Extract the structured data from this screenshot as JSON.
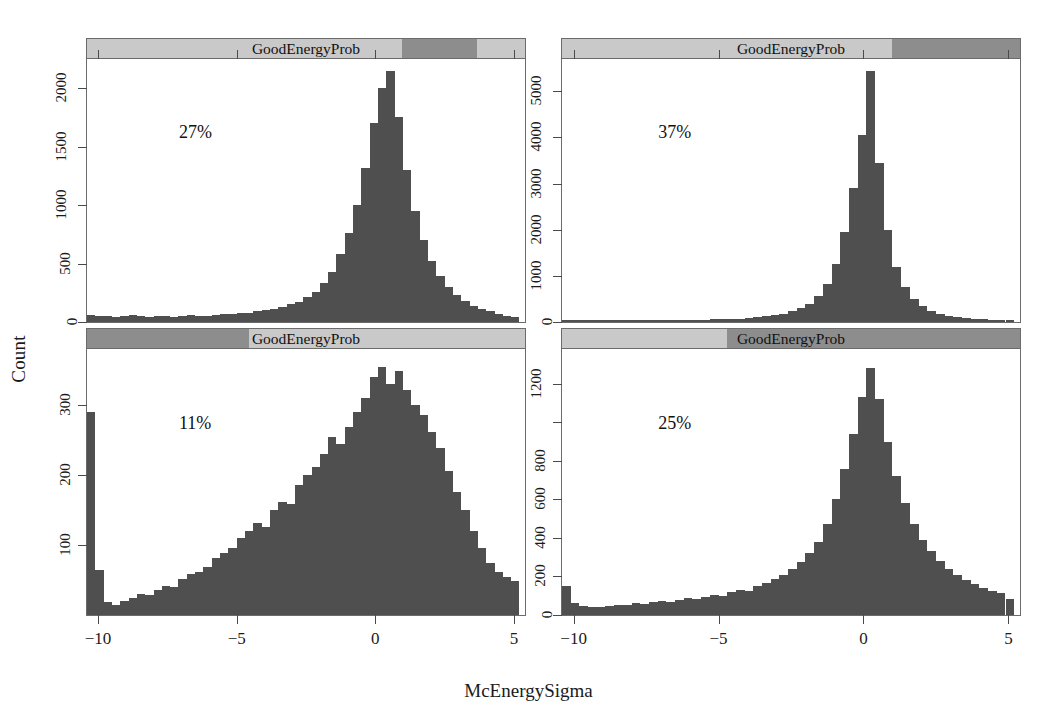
{
  "figure": {
    "ylabel": "Count",
    "xlabel": "McEnergySigma",
    "strip_label": "GoodEnergyProb",
    "bar_color": "#4f4f4f",
    "strip_color": "#c9c9c9",
    "strip_band_color": "#8d8d8d"
  },
  "chart_data": {
    "type": "bar",
    "title": "",
    "xlabel": "McEnergySigma",
    "ylabel": "Count",
    "xlim": [
      -10.4,
      5.4
    ],
    "xticks": [
      -10,
      -5,
      0,
      5
    ],
    "xtick_labels": [
      "−10",
      "−5",
      "0",
      "5"
    ],
    "grid": false,
    "legend": null,
    "layout": "2x2 trellis / lattice conditioned on GoodEnergyProb (shingle)",
    "panels": [
      {
        "position": "top-left",
        "annotation": "27%",
        "strip_label": "GoodEnergyProb",
        "strip_band_start_pct": 72,
        "strip_band_end_pct": 89,
        "ylim": [
          0,
          2250
        ],
        "yticks": [
          0,
          500,
          1000,
          1500,
          2000
        ],
        "ytick_labels": [
          "0",
          "500",
          "1000",
          "1500",
          "2000"
        ],
        "bin_width": 0.3,
        "bin_starts": [
          -10.4,
          -10.1,
          -9.8,
          -9.5,
          -9.2,
          -8.9,
          -8.6,
          -8.3,
          -8.0,
          -7.7,
          -7.4,
          -7.1,
          -6.8,
          -6.5,
          -6.2,
          -5.9,
          -5.6,
          -5.3,
          -5.0,
          -4.7,
          -4.4,
          -4.1,
          -3.8,
          -3.5,
          -3.2,
          -2.9,
          -2.6,
          -2.3,
          -2.0,
          -1.7,
          -1.4,
          -1.1,
          -0.8,
          -0.5,
          -0.2,
          0.1,
          0.4,
          0.7,
          1.0,
          1.3,
          1.6,
          1.9,
          2.2,
          2.5,
          2.8,
          3.1,
          3.4,
          3.7,
          4.0,
          4.3,
          4.6,
          4.9
        ],
        "values": [
          60,
          55,
          50,
          45,
          55,
          60,
          50,
          45,
          55,
          50,
          45,
          55,
          60,
          55,
          50,
          60,
          65,
          70,
          75,
          80,
          90,
          100,
          115,
          130,
          150,
          175,
          210,
          260,
          330,
          430,
          580,
          760,
          1000,
          1320,
          1700,
          2000,
          2150,
          1750,
          1300,
          950,
          700,
          520,
          390,
          300,
          230,
          180,
          140,
          110,
          90,
          70,
          55,
          45
        ]
      },
      {
        "position": "top-right",
        "annotation": "37%",
        "strip_label": "GoodEnergyProb",
        "strip_band_start_pct": 72,
        "strip_band_end_pct": 100,
        "ylim": [
          0,
          5700
        ],
        "yticks": [
          0,
          1000,
          2000,
          3000,
          4000,
          5000
        ],
        "ytick_labels": [
          "0",
          "1000",
          "2000",
          "3000",
          "4000",
          "5000"
        ],
        "bin_width": 0.3,
        "bin_starts": [
          -10.4,
          -10.1,
          -9.8,
          -9.5,
          -9.2,
          -8.9,
          -8.6,
          -8.3,
          -8.0,
          -7.7,
          -7.4,
          -7.1,
          -6.8,
          -6.5,
          -6.2,
          -5.9,
          -5.6,
          -5.3,
          -5.0,
          -4.7,
          -4.4,
          -4.1,
          -3.8,
          -3.5,
          -3.2,
          -2.9,
          -2.6,
          -2.3,
          -2.0,
          -1.7,
          -1.4,
          -1.1,
          -0.8,
          -0.5,
          -0.2,
          0.1,
          0.4,
          0.7,
          1.0,
          1.3,
          1.6,
          1.9,
          2.2,
          2.5,
          2.8,
          3.1,
          3.4,
          3.7,
          4.0,
          4.3,
          4.6,
          4.9
        ],
        "values": [
          40,
          35,
          30,
          30,
          35,
          30,
          30,
          35,
          30,
          30,
          35,
          40,
          35,
          40,
          45,
          45,
          50,
          55,
          60,
          65,
          75,
          85,
          100,
          120,
          145,
          180,
          230,
          300,
          400,
          560,
          820,
          1250,
          1950,
          2900,
          4050,
          5450,
          3450,
          2000,
          1200,
          760,
          500,
          340,
          240,
          175,
          130,
          100,
          80,
          65,
          55,
          45,
          40,
          35
        ]
      },
      {
        "position": "bottom-left",
        "annotation": "11%",
        "strip_label": "GoodEnergyProb",
        "strip_band_start_pct": 0,
        "strip_band_end_pct": 37,
        "ylim": [
          0,
          380
        ],
        "yticks": [
          100,
          200,
          300
        ],
        "ytick_labels": [
          "100",
          "200",
          "300"
        ],
        "bin_width": 0.3,
        "bin_starts": [
          -10.4,
          -10.1,
          -9.8,
          -9.5,
          -9.2,
          -8.9,
          -8.6,
          -8.3,
          -8.0,
          -7.7,
          -7.4,
          -7.1,
          -6.8,
          -6.5,
          -6.2,
          -5.9,
          -5.6,
          -5.3,
          -5.0,
          -4.7,
          -4.4,
          -4.1,
          -3.8,
          -3.5,
          -3.2,
          -2.9,
          -2.6,
          -2.3,
          -2.0,
          -1.7,
          -1.4,
          -1.1,
          -0.8,
          -0.5,
          -0.2,
          0.1,
          0.4,
          0.7,
          1.0,
          1.3,
          1.6,
          1.9,
          2.2,
          2.5,
          2.8,
          3.1,
          3.4,
          3.7,
          4.0,
          4.3,
          4.6,
          4.9
        ],
        "values": [
          290,
          65,
          18,
          14,
          20,
          24,
          30,
          28,
          36,
          42,
          40,
          52,
          58,
          62,
          68,
          82,
          88,
          96,
          110,
          120,
          132,
          126,
          150,
          162,
          158,
          186,
          200,
          212,
          230,
          254,
          244,
          268,
          290,
          310,
          340,
          355,
          330,
          348,
          322,
          300,
          286,
          262,
          238,
          206,
          176,
          150,
          120,
          96,
          74,
          62,
          54,
          48
        ]
      },
      {
        "position": "bottom-right",
        "annotation": "25%",
        "strip_label": "GoodEnergyProb",
        "strip_band_start_pct": 36,
        "strip_band_end_pct": 100,
        "ylim": [
          0,
          1380
        ],
        "yticks": [
          0,
          200,
          400,
          600,
          800,
          1000,
          1200
        ],
        "ytick_labels": [
          "0",
          "200",
          "400",
          "600",
          "800",
          "",
          "1200"
        ],
        "bin_width": 0.3,
        "bin_starts": [
          -10.4,
          -10.1,
          -9.8,
          -9.5,
          -9.2,
          -8.9,
          -8.6,
          -8.3,
          -8.0,
          -7.7,
          -7.4,
          -7.1,
          -6.8,
          -6.5,
          -6.2,
          -5.9,
          -5.6,
          -5.3,
          -5.0,
          -4.7,
          -4.4,
          -4.1,
          -3.8,
          -3.5,
          -3.2,
          -2.9,
          -2.6,
          -2.3,
          -2.0,
          -1.7,
          -1.4,
          -1.1,
          -0.8,
          -0.5,
          -0.2,
          0.1,
          0.4,
          0.7,
          1.0,
          1.3,
          1.6,
          1.9,
          2.2,
          2.5,
          2.8,
          3.1,
          3.4,
          3.7,
          4.0,
          4.3,
          4.6,
          4.9
        ],
        "values": [
          150,
          60,
          45,
          40,
          42,
          48,
          52,
          50,
          62,
          58,
          66,
          72,
          70,
          80,
          86,
          84,
          96,
          104,
          100,
          118,
          130,
          126,
          150,
          168,
          186,
          210,
          240,
          276,
          320,
          380,
          470,
          600,
          760,
          940,
          1130,
          1280,
          1120,
          900,
          720,
          580,
          470,
          390,
          330,
          280,
          240,
          206,
          180,
          160,
          142,
          126,
          112,
          84
        ]
      }
    ]
  }
}
